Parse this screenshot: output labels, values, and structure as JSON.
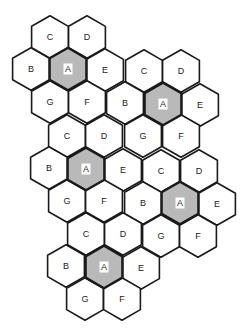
{
  "diagram": {
    "title": "",
    "type": "hexagonal cellular frequency-reuse pattern (7-cell clusters)",
    "hex_radius": 21.3,
    "colors": {
      "outline": "#1a1a1a",
      "cell_fill": "#ffffff",
      "center_cell_fill": "#b9b9b9",
      "label": "#222222"
    },
    "clusters": [
      {
        "id": 1,
        "center": [
          68,
          69
        ]
      },
      {
        "id": 2,
        "center": [
          163,
          104
        ]
      },
      {
        "id": 3,
        "center": [
          86,
          169
        ]
      },
      {
        "id": 4,
        "center": [
          180,
          203
        ]
      },
      {
        "id": 5,
        "center": [
          104,
          267
        ]
      }
    ],
    "cells": [
      {
        "label": "C",
        "x": 50,
        "y": 37,
        "shaded": false
      },
      {
        "label": "D",
        "x": 87,
        "y": 37,
        "shaded": false
      },
      {
        "label": "B",
        "x": 31,
        "y": 69,
        "shaded": false
      },
      {
        "label": "A",
        "x": 68,
        "y": 69,
        "shaded": true
      },
      {
        "label": "E",
        "x": 105,
        "y": 70,
        "shaded": false
      },
      {
        "label": "G",
        "x": 50,
        "y": 102,
        "shaded": false
      },
      {
        "label": "F",
        "x": 87,
        "y": 102,
        "shaded": false
      },
      {
        "label": "C",
        "x": 144,
        "y": 71,
        "shaded": false
      },
      {
        "label": "D",
        "x": 181,
        "y": 71,
        "shaded": false
      },
      {
        "label": "B",
        "x": 125,
        "y": 103,
        "shaded": false
      },
      {
        "label": "A",
        "x": 163,
        "y": 104,
        "shaded": true
      },
      {
        "label": "E",
        "x": 200,
        "y": 105,
        "shaded": false
      },
      {
        "label": "G",
        "x": 143,
        "y": 136,
        "shaded": false
      },
      {
        "label": "F",
        "x": 181,
        "y": 136,
        "shaded": false
      },
      {
        "label": "C",
        "x": 67,
        "y": 136,
        "shaded": false
      },
      {
        "label": "D",
        "x": 104,
        "y": 136,
        "shaded": false
      },
      {
        "label": "B",
        "x": 49,
        "y": 168,
        "shaded": false
      },
      {
        "label": "A",
        "x": 86,
        "y": 169,
        "shaded": true
      },
      {
        "label": "E",
        "x": 123,
        "y": 170,
        "shaded": false
      },
      {
        "label": "G",
        "x": 67,
        "y": 201,
        "shaded": false
      },
      {
        "label": "F",
        "x": 104,
        "y": 201,
        "shaded": false
      },
      {
        "label": "C",
        "x": 161,
        "y": 171,
        "shaded": false
      },
      {
        "label": "D",
        "x": 199,
        "y": 171,
        "shaded": false
      },
      {
        "label": "B",
        "x": 143,
        "y": 203,
        "shaded": false
      },
      {
        "label": "A",
        "x": 180,
        "y": 203,
        "shaded": true
      },
      {
        "label": "E",
        "x": 217,
        "y": 204,
        "shaded": false
      },
      {
        "label": "G",
        "x": 161,
        "y": 236,
        "shaded": false
      },
      {
        "label": "F",
        "x": 198,
        "y": 236,
        "shaded": false
      },
      {
        "label": "C",
        "x": 86,
        "y": 234,
        "shaded": false
      },
      {
        "label": "D",
        "x": 123,
        "y": 234,
        "shaded": false
      },
      {
        "label": "B",
        "x": 66,
        "y": 266,
        "shaded": false
      },
      {
        "label": "A",
        "x": 104,
        "y": 267,
        "shaded": true
      },
      {
        "label": "E",
        "x": 141,
        "y": 268,
        "shaded": false
      },
      {
        "label": "G",
        "x": 85,
        "y": 299,
        "shaded": false
      },
      {
        "label": "F",
        "x": 122,
        "y": 299,
        "shaded": false
      }
    ]
  }
}
